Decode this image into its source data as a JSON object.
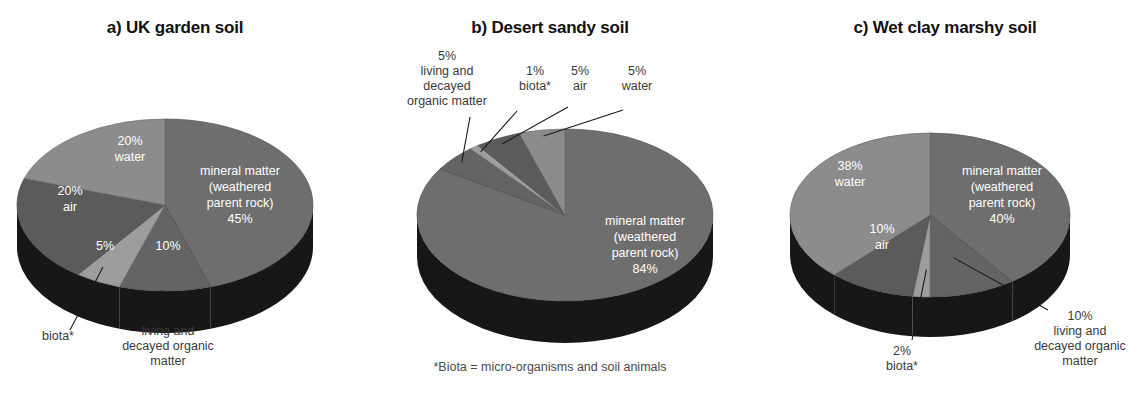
{
  "figure": {
    "footnote": "*Biota = micro-organisms and soil animals",
    "background": "#ffffff"
  },
  "palette": {
    "mineral": "#6e6e6e",
    "organic": "#646464",
    "biota": "#9d9d9d",
    "air": "#5b5b5b",
    "water": "#8c8c8c",
    "side_wall": "#171717",
    "side_wall_light": "#3a3a3a",
    "label_inner": "#ffffff",
    "label_outer": "#3a3a3a",
    "title": "#111111"
  },
  "chart_data": [
    {
      "type": "pie",
      "id": "uk-garden-soil",
      "title": "a) UK garden soil",
      "categories": [
        "mineral matter (weathered parent rock)",
        "living and decayed organic matter",
        "biota*",
        "air",
        "water"
      ],
      "values": [
        45,
        10,
        5,
        20,
        20
      ],
      "labels": [
        {
          "pct": "45%",
          "name": "mineral matter\n(weathered\nparent rock)",
          "placement": "inside"
        },
        {
          "pct": "10%",
          "name": "living and decayed organic matter",
          "placement": "callout-bottom"
        },
        {
          "pct": "5%",
          "name": "biota*",
          "placement": "callout-bottom"
        },
        {
          "pct": "20%",
          "name": "air",
          "placement": "inside"
        },
        {
          "pct": "20%",
          "name": "water",
          "placement": "inside"
        }
      ],
      "inner_text": {
        "mineral": [
          "mineral matter",
          "(weathered",
          "parent rock)",
          "45%"
        ],
        "water": [
          "20%",
          "water"
        ],
        "air": [
          "20%",
          "air"
        ],
        "biota_pct": "5%",
        "organic_pct": "10%"
      },
      "outer_text": {
        "biota": [
          "biota*"
        ],
        "organic": [
          "living and",
          "decayed organic",
          "matter"
        ]
      }
    },
    {
      "type": "pie",
      "id": "desert-sandy-soil",
      "title": "b) Desert sandy soil",
      "categories": [
        "mineral matter (weathered parent rock)",
        "living and decayed organic matter",
        "biota*",
        "air",
        "water"
      ],
      "values": [
        84,
        5,
        1,
        5,
        5
      ],
      "labels": [
        {
          "pct": "84%",
          "name": "mineral matter\n(weathered\nparent rock)",
          "placement": "inside"
        },
        {
          "pct": "5%",
          "name": "living and decayed organic matter",
          "placement": "callout-top"
        },
        {
          "pct": "1%",
          "name": "biota*",
          "placement": "callout-top"
        },
        {
          "pct": "5%",
          "name": "air",
          "placement": "callout-top"
        },
        {
          "pct": "5%",
          "name": "water",
          "placement": "callout-top"
        }
      ],
      "inner_text": {
        "mineral": [
          "mineral matter",
          "(weathered",
          "parent rock)",
          "84%"
        ]
      },
      "outer_text": {
        "organic": [
          "5%",
          "living and",
          "decayed",
          "organic matter"
        ],
        "biota": [
          "1%",
          "biota*"
        ],
        "air": [
          "5%",
          "air"
        ],
        "water": [
          "5%",
          "water"
        ]
      }
    },
    {
      "type": "pie",
      "id": "wet-clay-marshy-soil",
      "title": "c) Wet clay marshy soil",
      "categories": [
        "mineral matter (weathered parent rock)",
        "living and decayed organic matter",
        "biota*",
        "air",
        "water"
      ],
      "values": [
        40,
        10,
        2,
        10,
        38
      ],
      "labels": [
        {
          "pct": "40%",
          "name": "mineral matter\n(weathered\nparent rock)",
          "placement": "inside"
        },
        {
          "pct": "10%",
          "name": "living and decayed organic matter",
          "placement": "callout-bottom"
        },
        {
          "pct": "2%",
          "name": "biota*",
          "placement": "callout-bottom"
        },
        {
          "pct": "10%",
          "name": "air",
          "placement": "inside"
        },
        {
          "pct": "38%",
          "name": "water",
          "placement": "inside"
        }
      ],
      "inner_text": {
        "mineral": [
          "mineral matter",
          "(weathered",
          "parent rock)",
          "40%"
        ],
        "water": [
          "38%",
          "water"
        ],
        "air": [
          "10%",
          "air"
        ]
      },
      "outer_text": {
        "biota": [
          "2%",
          "biota*"
        ],
        "organic": [
          "10%",
          "living and",
          "decayed organic",
          "matter"
        ]
      }
    }
  ]
}
